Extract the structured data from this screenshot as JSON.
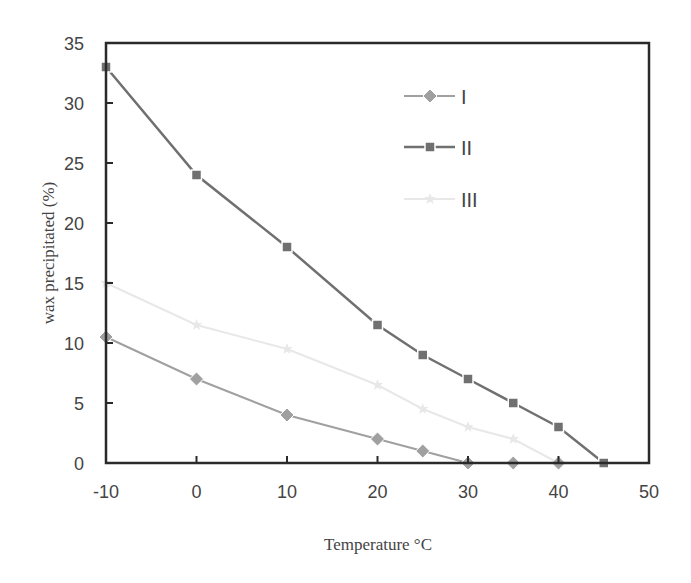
{
  "chart_data": {
    "type": "line",
    "title": "",
    "xlabel": "Temperature °C",
    "ylabel": "wax precipitated (%)",
    "xlim": [
      -10,
      50
    ],
    "ylim": [
      0,
      35
    ],
    "xticks": [
      -10,
      0,
      10,
      20,
      30,
      40,
      50
    ],
    "yticks": [
      0,
      5,
      10,
      15,
      20,
      25,
      30,
      35
    ],
    "grid": false,
    "legend_position": "upper right (inside plot)",
    "series": [
      {
        "name": "I",
        "marker": "diamond",
        "color": "#a0a0a0",
        "x": [
          -10,
          0,
          10,
          20,
          25,
          30,
          35,
          40
        ],
        "values": [
          10.5,
          7.0,
          4.0,
          2.0,
          1.0,
          0.0,
          0.0,
          0.0
        ]
      },
      {
        "name": "II",
        "marker": "square",
        "color": "#707070",
        "x": [
          -10,
          0,
          10,
          20,
          25,
          30,
          35,
          40,
          45
        ],
        "values": [
          33.0,
          24.0,
          18.0,
          11.5,
          9.0,
          7.0,
          5.0,
          3.0,
          0.0
        ]
      },
      {
        "name": "III",
        "marker": "star",
        "color": "#e8e8e8",
        "x": [
          -10,
          0,
          10,
          20,
          25,
          30,
          35,
          40
        ],
        "values": [
          15.0,
          11.5,
          9.5,
          6.5,
          4.5,
          3.0,
          2.0,
          0.0
        ]
      }
    ]
  },
  "axes": {
    "x_title": "Temperature °C",
    "y_title": "wax precipitated (%)"
  },
  "legend": {
    "items": [
      {
        "label": "I"
      },
      {
        "label": "II"
      },
      {
        "label": "III"
      }
    ]
  }
}
